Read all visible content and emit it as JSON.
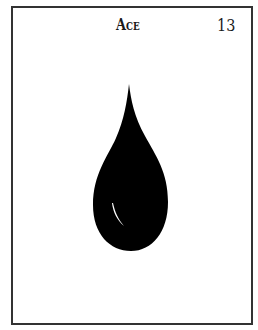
{
  "card": {
    "title": "Ace",
    "number": "13",
    "icon": "water-drop-icon",
    "colors": {
      "border": "#333333",
      "icon": "#000000",
      "background": "#ffffff",
      "highlight": "#ffffff"
    }
  }
}
